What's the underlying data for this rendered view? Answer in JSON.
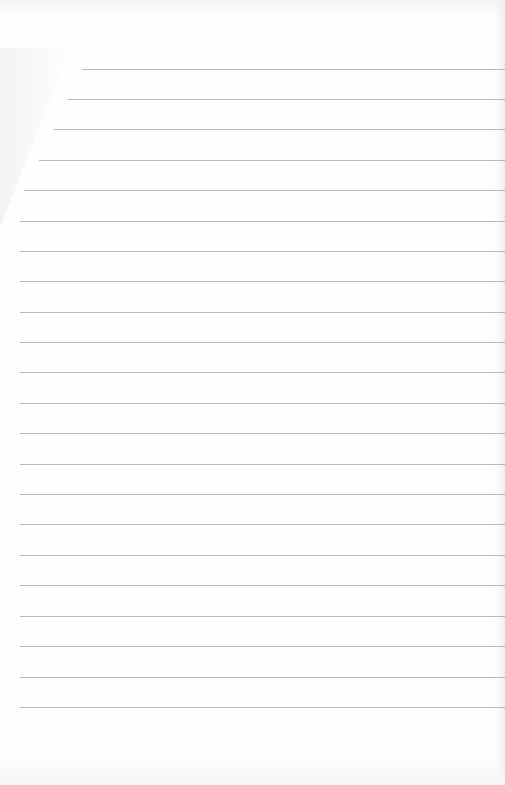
{
  "image": {
    "description": "Blank sheet of ruled notebook paper",
    "paper_color": "#fefefe",
    "line_color": "#b9b9b9",
    "line_count": 22,
    "line_spacing_px": 30.4,
    "first_line_y": 69,
    "lines": [
      {
        "y": 69,
        "x_start": 82
      },
      {
        "y": 99,
        "x_start": 68
      },
      {
        "y": 129,
        "x_start": 54
      },
      {
        "y": 160,
        "x_start": 39
      },
      {
        "y": 190,
        "x_start": 24
      },
      {
        "y": 221,
        "x_start": 20
      },
      {
        "y": 251,
        "x_start": 20
      },
      {
        "y": 281,
        "x_start": 20
      },
      {
        "y": 312,
        "x_start": 20
      },
      {
        "y": 342,
        "x_start": 20
      },
      {
        "y": 372,
        "x_start": 20
      },
      {
        "y": 403,
        "x_start": 20
      },
      {
        "y": 433,
        "x_start": 20
      },
      {
        "y": 464,
        "x_start": 20
      },
      {
        "y": 494,
        "x_start": 20
      },
      {
        "y": 524,
        "x_start": 20
      },
      {
        "y": 555,
        "x_start": 20
      },
      {
        "y": 585,
        "x_start": 20
      },
      {
        "y": 616,
        "x_start": 20
      },
      {
        "y": 646,
        "x_start": 20
      },
      {
        "y": 677,
        "x_start": 20
      },
      {
        "y": 707,
        "x_start": 20
      }
    ]
  }
}
